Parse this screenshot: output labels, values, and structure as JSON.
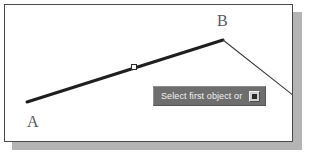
{
  "canvas": {
    "background_color": "#ffffff",
    "border_color": "#4a4a4a",
    "shadow_color": "#b4b4b4"
  },
  "geometry": {
    "selected_line": {
      "label": "selected-polyline-segment",
      "color": "#1f1f1f",
      "stroke_width": 3,
      "start": {
        "x": 22,
        "y": 97,
        "point_label": "A"
      },
      "end": {
        "x": 218,
        "y": 35,
        "point_label": "B"
      }
    },
    "unselected_line": {
      "label": "adjacent-line-segment",
      "color": "#3a3a3a",
      "stroke_width": 1,
      "start": {
        "x": 218,
        "y": 35,
        "point_label": "B"
      },
      "end": {
        "x": 289,
        "y": 91,
        "point_label": ""
      }
    },
    "grip": {
      "label": "pick-point-grip",
      "x": 129,
      "y": 62,
      "size": 5,
      "fill_color": "#ffffff",
      "border_color": "#2a2a2a"
    }
  },
  "labels": {
    "point_a": "A",
    "point_b": "B"
  },
  "tooltip": {
    "prompt_text": "Select first object or",
    "background_color": "#6e6e6e",
    "text_color": "#f2f2f2",
    "options_button_icon": "filled-square-icon"
  }
}
